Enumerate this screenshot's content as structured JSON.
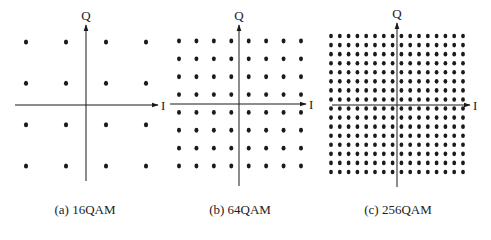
{
  "figure": {
    "panels": [
      {
        "id": "a",
        "caption": "(a) 16QAM",
        "order": 4,
        "x_axis_label": "I",
        "y_axis_label": "Q",
        "axis": {
          "cx": 86,
          "cy": 105,
          "x_start": 15,
          "x_end": 158,
          "y_top": 25,
          "y_bottom": 181
        },
        "dots": {
          "x0": 26,
          "x1": 146,
          "y0": 42,
          "y1": 166,
          "r": 2.3
        },
        "caption_x": 85
      },
      {
        "id": "b",
        "caption": "(b) 64QAM",
        "order": 8,
        "x_axis_label": "I",
        "y_axis_label": "Q",
        "axis": {
          "cx": 239,
          "cy": 104,
          "x_start": 170,
          "x_end": 306,
          "y_top": 25,
          "y_bottom": 186
        },
        "dots": {
          "x0": 179,
          "x1": 301,
          "y0": 41,
          "y1": 166,
          "r": 2.2
        },
        "caption_x": 240
      },
      {
        "id": "c",
        "caption": "(c) 256QAM",
        "order": 16,
        "x_axis_label": "I",
        "y_axis_label": "Q",
        "axis": {
          "cx": 397,
          "cy": 105,
          "x_start": 332,
          "x_end": 470,
          "y_top": 23,
          "y_bottom": 187
        },
        "dots": {
          "x0": 331,
          "x1": 463,
          "y0": 36,
          "y1": 172,
          "r": 2.1
        },
        "caption_x": 398
      }
    ],
    "colors": {
      "ink": "#1a1a1a",
      "background": "#ffffff"
    }
  }
}
